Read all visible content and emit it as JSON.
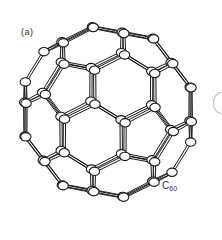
{
  "figure": {
    "panel_label": "(a)",
    "molecule_label": {
      "main": "C",
      "subscript": "60"
    },
    "molecule": {
      "name": "C60 fullerene",
      "representation": "ball-and-stick",
      "atom_count": 60,
      "center": [
        108,
        112
      ],
      "radius": 88,
      "atom_fill": "#ffffff",
      "stroke": "#1a1a1a"
    }
  }
}
